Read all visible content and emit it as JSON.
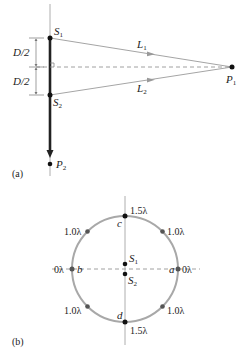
{
  "figure_a": {
    "panel_label": "(a)",
    "source1": {
      "letter": "S",
      "sub": "1"
    },
    "source2": {
      "letter": "S",
      "sub": "2"
    },
    "point1": {
      "letter": "P",
      "sub": "1"
    },
    "point2": {
      "letter": "P",
      "sub": "2"
    },
    "path1": {
      "letter": "L",
      "sub": "1"
    },
    "path2": {
      "letter": "L",
      "sub": "2"
    },
    "half_sep_top": "D/2",
    "half_sep_bottom": "D/2"
  },
  "figure_b": {
    "panel_label": "(b)",
    "source1": {
      "letter": "S",
      "sub": "1"
    },
    "source2": {
      "letter": "S",
      "sub": "2"
    },
    "points": {
      "a": {
        "label": "a",
        "value": "0λ"
      },
      "b": {
        "label": "b",
        "value": "0λ"
      },
      "c": {
        "label": "c",
        "value": "1.5λ"
      },
      "d": {
        "label": "d",
        "value": "1.5λ"
      },
      "upper_left": {
        "value": "1.0λ"
      },
      "upper_right": {
        "value": "1.0λ"
      },
      "lower_left": {
        "value": "1.0λ"
      },
      "lower_right": {
        "value": "1.0λ"
      }
    }
  },
  "colors": {
    "line": "#9a9a9a",
    "ink": "#111111",
    "circle": "#a8a8a8",
    "dot_gray": "#555555"
  }
}
